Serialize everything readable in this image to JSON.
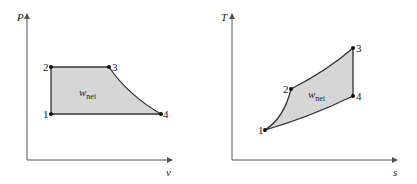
{
  "diagrams": [
    {
      "name": "pv-diagram",
      "y_axis_label": "P",
      "x_axis_label": "v",
      "area_label_main": "w",
      "area_label_sub": "net",
      "points": [
        {
          "label": "1"
        },
        {
          "label": "2"
        },
        {
          "label": "3"
        },
        {
          "label": "4"
        }
      ]
    },
    {
      "name": "ts-diagram",
      "y_axis_label": "T",
      "x_axis_label": "s",
      "area_label_main": "w",
      "area_label_sub": "net",
      "points": [
        {
          "label": "1"
        },
        {
          "label": "2"
        },
        {
          "label": "3"
        },
        {
          "label": "4"
        }
      ]
    }
  ],
  "colors": {
    "fill": "#d6d6d6",
    "stroke": "#333333",
    "axis": "#555555"
  }
}
